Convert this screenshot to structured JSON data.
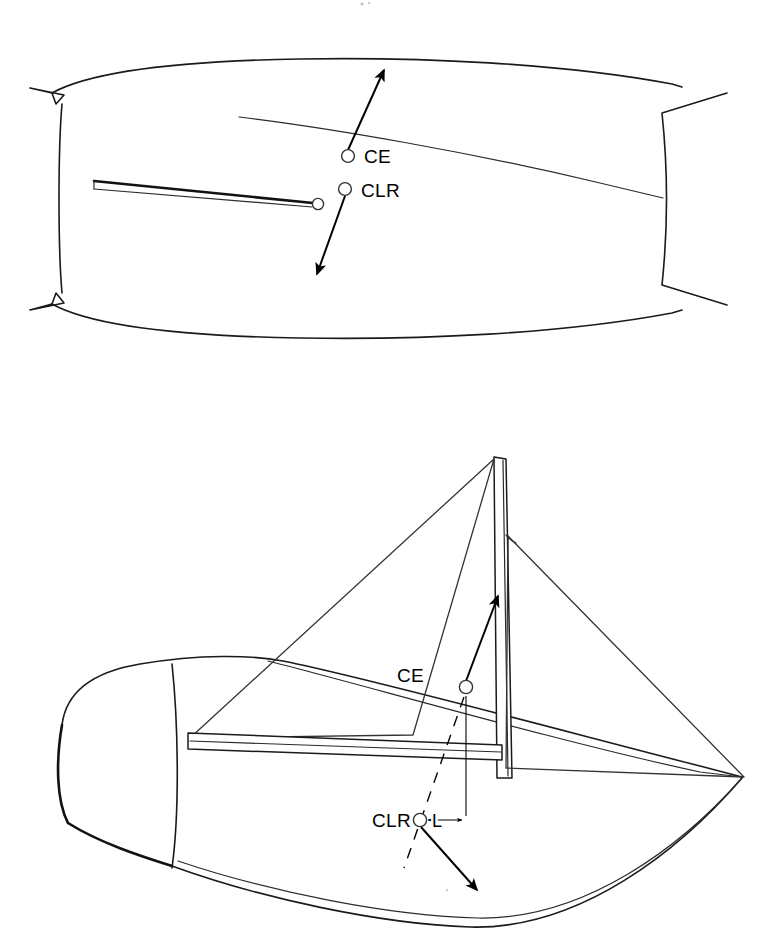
{
  "figure": {
    "background_color": "#ffffff",
    "ink_color": "#1a1a1a",
    "width": 784,
    "height": 949
  },
  "labels": {
    "ce_top": "CE",
    "clr_top": "CLR",
    "ce_side": "CE",
    "clr_side": "CLR",
    "lead_dimension": "L"
  },
  "views": {
    "plan": {
      "name": "plan-view",
      "caption": "",
      "markers": [
        {
          "id": "ce",
          "label": "CE",
          "x": 348,
          "y": 156
        },
        {
          "id": "clr",
          "label": "CLR",
          "x": 345,
          "y": 189
        }
      ],
      "arrows": [
        {
          "id": "ce-force-arrow",
          "from_x": 348,
          "from_y": 152,
          "to_x": 385,
          "to_y": 68,
          "label": ""
        },
        {
          "id": "clr-force-arrow",
          "from_x": 345,
          "from_y": 194,
          "to_x": 316,
          "to_y": 277,
          "label": ""
        }
      ]
    },
    "perspective": {
      "name": "perspective-view",
      "caption": "",
      "markers": [
        {
          "id": "ce",
          "label": "CE",
          "x": 466,
          "y": 687
        },
        {
          "id": "clr",
          "label": "CLR",
          "x": 420,
          "y": 820
        }
      ],
      "arrows": [
        {
          "id": "ce-force-arrow",
          "from_x": 466,
          "from_y": 681,
          "to_x": 500,
          "to_y": 592,
          "label": ""
        },
        {
          "id": "clr-force-arrow",
          "from_x": 420,
          "from_y": 826,
          "to_x": 478,
          "to_y": 892,
          "label": ""
        }
      ],
      "dimension": {
        "id": "lead-dimension",
        "label": "L",
        "from_x": 420,
        "to_x": 466,
        "y": 820
      }
    }
  },
  "annotations": {
    "marker_shape": "open-circle",
    "dimension_style": "double-arrow",
    "leader_style": "dashed"
  },
  "icons": {
    "ce_marker": "circle-marker-icon",
    "clr_marker": "circle-marker-icon",
    "force_arrow": "arrow-icon",
    "dimension_arrow": "double-arrow-icon"
  }
}
